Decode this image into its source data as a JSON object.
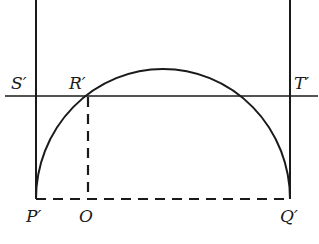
{
  "diagram": {
    "labels": {
      "S": "S′",
      "R": "R′",
      "T": "T′",
      "P": "P′",
      "O": "O",
      "Q": "Q′"
    },
    "colors": {
      "stroke": "#1a1a1a",
      "background": "#ffffff"
    },
    "elements": [
      "vertical line through P′",
      "vertical line through Q′",
      "horizontal line S′T′",
      "semicircular arc from P′ to Q′",
      "dashed segment P′Q′",
      "dashed segment R′O"
    ]
  }
}
